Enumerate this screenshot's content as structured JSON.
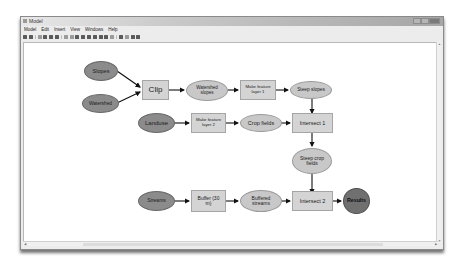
{
  "window": {
    "title": "Model",
    "controls": [
      "minimize",
      "maximize",
      "close"
    ]
  },
  "menubar": {
    "items": [
      "Model",
      "Edit",
      "Insert",
      "View",
      "Windows",
      "Help"
    ]
  },
  "toolbar": {
    "icons": [
      "save-icon",
      "print-icon",
      "cut-icon",
      "copy-icon",
      "paste-icon",
      "delete-icon",
      "undo-icon",
      "redo-icon",
      "add-data-icon",
      "auto-layout-icon",
      "full-extent-icon",
      "zoom-in-fixed-icon",
      "zoom-out-fixed-icon",
      "zoom-icon",
      "pan-icon",
      "select-icon",
      "connect-icon",
      "validate-icon",
      "run-icon"
    ]
  },
  "diagram": {
    "nodes": {
      "slopes": "Slopes",
      "watershed": "Watershed",
      "clip": "Clip",
      "watershed_slopes": "Watershed slopes",
      "make_feature_layer_1": "Make feature layer 1",
      "steep_slopes": "Steep slopes",
      "landuse": "Landuse",
      "make_feature_layer_2": "Make feature layer 2",
      "crop_fields": "Crop fields",
      "intersect_1": "Intersect 1",
      "steep_crop_fields": "Steep crop fields",
      "streams": "Streams",
      "buffer": "Buffer (30 m)",
      "buffered_streams": "Buffered streams",
      "intersect_2": "Intersect 2",
      "results": "Results"
    },
    "edges": [
      [
        "slopes",
        "clip"
      ],
      [
        "watershed",
        "clip"
      ],
      [
        "clip",
        "watershed_slopes"
      ],
      [
        "watershed_slopes",
        "make_feature_layer_1"
      ],
      [
        "make_feature_layer_1",
        "steep_slopes"
      ],
      [
        "steep_slopes",
        "intersect_1"
      ],
      [
        "landuse",
        "make_feature_layer_2"
      ],
      [
        "make_feature_layer_2",
        "crop_fields"
      ],
      [
        "crop_fields",
        "intersect_1"
      ],
      [
        "intersect_1",
        "steep_crop_fields"
      ],
      [
        "steep_crop_fields",
        "intersect_2"
      ],
      [
        "streams",
        "buffer"
      ],
      [
        "buffer",
        "buffered_streams"
      ],
      [
        "buffered_streams",
        "intersect_2"
      ],
      [
        "intersect_2",
        "results"
      ]
    ],
    "colors": {
      "input": "#8b8b8b",
      "tool": "#d4d4d4",
      "derived": "#c8c8c8",
      "result": "#707070",
      "arrow": "#111111"
    }
  }
}
